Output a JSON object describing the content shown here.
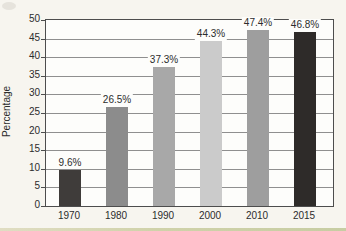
{
  "chart_data": {
    "type": "bar",
    "title": "",
    "categories": [
      "1970",
      "1980",
      "1990",
      "2000",
      "2010",
      "2015"
    ],
    "values": [
      9.6,
      26.5,
      37.3,
      44.3,
      47.4,
      46.8
    ],
    "value_labels": [
      "9.6%",
      "26.5%",
      "37.3%",
      "44.3%",
      "47.4%",
      "46.8%"
    ],
    "bar_colors": [
      "#3f3c3a",
      "#8c8c8c",
      "#a8a8a8",
      "#cbcbcb",
      "#9e9e9e",
      "#2e2b29"
    ],
    "xlabel": "",
    "ylabel": "Percentage",
    "ylim": [
      0,
      50
    ],
    "ytick_step": 5,
    "yticks": [
      0,
      5,
      10,
      15,
      20,
      25,
      30,
      35,
      40,
      45,
      50
    ],
    "grid": true,
    "legend": "none",
    "colors": {
      "grid": "#8f8f8f",
      "axis": "#4d4d4d",
      "plot_background": "#fdfdfb",
      "page_background": "#f7f5ef",
      "text": "#2c2c2c",
      "scan_artifact": "#c9cc9e"
    }
  }
}
